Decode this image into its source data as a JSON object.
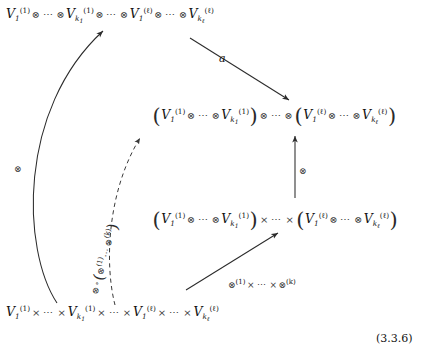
{
  "figure": {
    "equation_number": "(3.3.6)",
    "type": "commutative-diagram"
  },
  "nodes": {
    "top": {
      "id": "top-row",
      "text": "V_1^{(1)} ⊗ ⋯ ⊗ V_{k_1}^{(1)} ⊗ ⋯ ⊗ V_1^{(ℓ)} ⊗ ⋯ ⊗ V_{k_ℓ}^{(ℓ)}",
      "parts": [
        {
          "v": "V",
          "sub": "1",
          "sup": "(1)"
        },
        {
          "op": "⊗"
        },
        {
          "dots": "⋯"
        },
        {
          "op": "⊗"
        },
        {
          "v": "V",
          "sub": "k",
          "subsub": "1",
          "sup": "(1)"
        },
        {
          "op": "⊗"
        },
        {
          "dots": "⋯"
        },
        {
          "op": "⊗"
        },
        {
          "v": "V",
          "sub": "1",
          "sup": "(ℓ)"
        },
        {
          "op": "⊗"
        },
        {
          "dots": "⋯"
        },
        {
          "op": "⊗"
        },
        {
          "v": "V",
          "sub": "k",
          "subsub": "ℓ",
          "sup": "(ℓ)"
        }
      ]
    },
    "middle_upper": {
      "id": "middle-upper-row",
      "text": "( V_1^{(1)} ⊗ ⋯ ⊗ V_{k_1}^{(1)} ) ⊗ ⋯ ⊗ ( V_1^{(ℓ)} ⊗ ⋯ ⊗ V_{k_ℓ}^{(ℓ)} )",
      "group_separator": "⊗"
    },
    "middle_lower": {
      "id": "middle-lower-row",
      "text": "( V_1^{(1)} ⊗ ⋯ ⊗ V_{k_1}^{(1)} ) × ⋯ × ( V_1^{(ℓ)} ⊗ ⋯ ⊗ V_{k_ℓ}^{(ℓ)} )",
      "group_separator": "×"
    },
    "bottom": {
      "id": "bottom-row",
      "text": "V_1^{(1)} × ⋯ × V_{k_1}^{(1)} × ⋯ × V_1^{(ℓ)} × ⋯ × V_{k_ℓ}^{(ℓ)}",
      "separator": "×"
    }
  },
  "arrows": {
    "diagonal_a": {
      "label": "a",
      "from": "top-row",
      "to": "middle-upper-row",
      "style": "solid"
    },
    "vertical_tensor": {
      "label": "⊗",
      "from": "middle-lower-row",
      "to": "middle-upper-row",
      "style": "solid"
    },
    "bottom_diagonal": {
      "label_parts": [
        {
          "op": "⊗",
          "sup": "(1)"
        },
        {
          "times": "×"
        },
        {
          "dots": "⋯"
        },
        {
          "times": "×"
        },
        {
          "op": "⊗",
          "sup": "(k)"
        }
      ],
      "label": "⊗^{(1)} × ⋯ × ⊗^{(k)}",
      "from": "bottom-row",
      "to": "middle-lower-row",
      "style": "solid"
    },
    "curved_left": {
      "label": "⊗",
      "from": "bottom-row",
      "to": "top-row",
      "style": "curved-solid"
    },
    "dashed_composite": {
      "label": "⊗ ∘ ( ⊗^{(1)} ⋯ ⊗^{(k)} )",
      "label_parts": [
        {
          "op": "⊗"
        },
        {
          "circ": "∘"
        },
        {
          "lparen": "("
        },
        {
          "op": "⊗",
          "sup": "(1)"
        },
        {
          "dots": "⋯"
        },
        {
          "op": "⊗",
          "sup": "(k)"
        },
        {
          "rparen": ")"
        }
      ],
      "from": "bottom-row",
      "to": "middle-upper-row",
      "style": "curved-dashed"
    }
  },
  "colors": {
    "ink": "#121212",
    "operator": "#3a3a3a",
    "arrow": "#2b2b2b",
    "background": "#ffffff"
  }
}
